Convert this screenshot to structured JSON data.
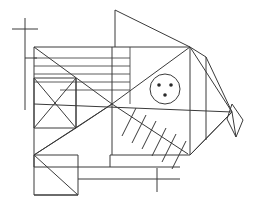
{
  "figure": {
    "style": "technical line art",
    "background_color": "#ffffff",
    "stroke_color": "#3a3a3a",
    "stroke_width": 1,
    "canvas": {
      "width": 256,
      "height": 210
    },
    "parts": [
      {
        "name": "body-outline",
        "label": "Body outline",
        "kind": "polygon",
        "points": "34,47 190,47 206,57 228,112 190,155 110,155 110,167 34,167"
      },
      {
        "name": "dorsal-fin",
        "label": "Dorsal fin triangle",
        "kind": "triangle",
        "points": "115,10 115,47 190,47"
      },
      {
        "name": "tail-fin",
        "label": "Tail fin triangle",
        "kind": "triangle",
        "points": "206,57 232,112 190,155"
      },
      {
        "name": "tail-tip-diamond",
        "label": "Tail tip diamond",
        "kind": "diamond",
        "points": "232,105 243,120 236,137 227,120"
      },
      {
        "name": "eye-circle",
        "label": "Eye circle",
        "kind": "circle",
        "cx": 165,
        "cy": 89,
        "r": 15
      },
      {
        "name": "eye-dots",
        "label": "Eye inner dots",
        "kind": "dots",
        "count": 3,
        "positions": [
          [
            159,
            85
          ],
          [
            171,
            85
          ],
          [
            165,
            95
          ]
        ],
        "radius": 1.7
      },
      {
        "name": "rib-spine",
        "label": "Rib spine diagonal",
        "kind": "line",
        "from": [
          112,
          104
        ],
        "to": [
          188,
          154
        ]
      },
      {
        "name": "rib-hatches",
        "label": "Rib hatch marks",
        "kind": "hatch-group",
        "count": 6
      },
      {
        "name": "scale-stripes",
        "label": "Horizontal scale stripes",
        "kind": "lines",
        "count": 5
      },
      {
        "name": "pectoral-x-box",
        "label": "Crossed pectoral box",
        "kind": "box-with-x",
        "rect": [
          34,
          78,
          76,
          128
        ]
      },
      {
        "name": "lower-fin-box",
        "label": "Lower fin box with diagonal",
        "kind": "box-with-diagonal",
        "rect": [
          34,
          155,
          78,
          195
        ]
      },
      {
        "name": "left-registration-mark",
        "label": "Left registration cross mark",
        "kind": "cross",
        "vertical": [
          [
            25,
            18
          ],
          [
            25,
            110
          ]
        ],
        "horizontal": [
          [
            12,
            29
          ],
          [
            38,
            29
          ]
        ],
        "tick": [
          [
            25,
            58
          ],
          [
            38,
            58
          ]
        ]
      },
      {
        "name": "bottom-registration-mark",
        "label": "Bottom registration cross mark",
        "kind": "cross",
        "horizontal": [
          [
            78,
            167
          ],
          [
            180,
            167
          ]
        ],
        "vertical": [
          [
            157,
            160
          ],
          [
            157,
            190
          ]
        ]
      }
    ]
  }
}
